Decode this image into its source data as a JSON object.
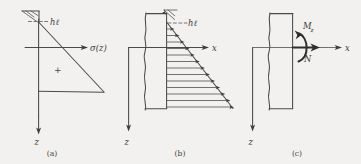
{
  "figure": {
    "title": "",
    "background_color": "#f2f1ef",
    "ink_color": "#4a4a4a",
    "style": "hand-drawn sketch"
  },
  "panels": [
    {
      "id": "a",
      "caption": "(a)",
      "labels": {
        "depth_axis": "z",
        "stress_axis": "σ(z)",
        "head_label": "hℓ",
        "sign_label": "+"
      },
      "description": "linear stress distribution triangle with ground-surface hatch symbol"
    },
    {
      "id": "b",
      "caption": "(b)",
      "labels": {
        "depth_axis": "z",
        "horizontal_axis": "x",
        "head_label": "hℓ"
      },
      "description": "wall section with triangular pressure distribution arrows",
      "arrow_count": 13
    },
    {
      "id": "c",
      "caption": "(c)",
      "labels": {
        "depth_axis": "z",
        "horizontal_axis": "x",
        "moment": "M",
        "moment_subscript": "z",
        "normal_force": "N"
      },
      "description": "wall section resultant normal force N and moment Mz"
    }
  ]
}
